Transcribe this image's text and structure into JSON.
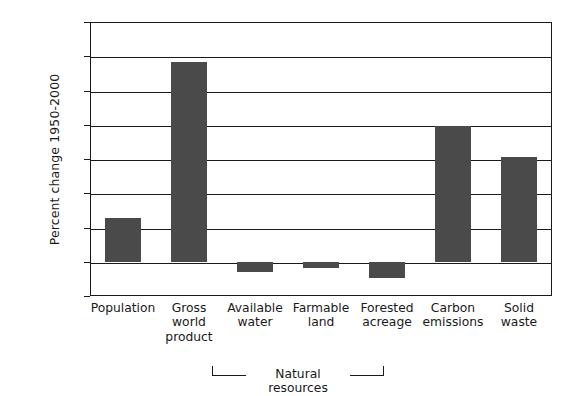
{
  "chart_data": {
    "type": "bar",
    "title": "",
    "xlabel": "",
    "ylabel": "Percent change 1950-2000",
    "categories": [
      "Population",
      "Gross world product",
      "Available water",
      "Farmable land",
      "Forested acreage",
      "Carbon emissions",
      "Solid waste"
    ],
    "category_lines": [
      [
        "Population"
      ],
      [
        "Gross",
        "world",
        "product"
      ],
      [
        "Available",
        "water"
      ],
      [
        "Farmable",
        "land"
      ],
      [
        "Forested",
        "acreage"
      ],
      [
        "Carbon",
        "emissions"
      ],
      [
        "Solid",
        "waste"
      ]
    ],
    "values": [
      128,
      583,
      -30,
      -19,
      -48,
      395,
      307
    ],
    "ylim": [
      -100,
      700
    ],
    "yticks": [
      -100,
      0,
      100,
      200,
      300,
      400,
      500,
      600,
      700
    ],
    "ytick_labels": [
      "-100",
      "0",
      "100",
      "200",
      "300",
      "400",
      "500",
      "600",
      "700"
    ],
    "grid": true,
    "grid_axis": "y",
    "legend": null,
    "bar_color": "#4a4a4a",
    "axis_color": "#1a1a1a",
    "background": "#ffffff",
    "annotations": [
      {
        "type": "group-bracket",
        "label": "Natural resources",
        "spans": [
          "Available water",
          "Farmable land",
          "Forested acreage"
        ]
      }
    ]
  }
}
